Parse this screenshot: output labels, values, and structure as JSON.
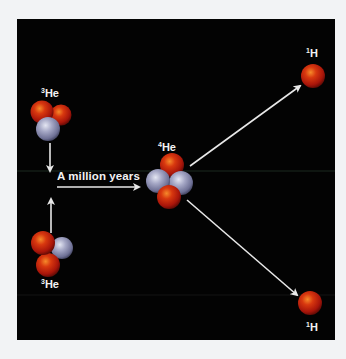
{
  "diagram": {
    "background_color": "#f2f3f5",
    "panel_color": "#030303",
    "proton_color": "#c8200c",
    "neutron_color": "#9a9cbc",
    "arrow_color": "#e8e8e8",
    "nodes": [
      {
        "id": "he3_top",
        "mass": "3",
        "symbol": "He",
        "protons": 2,
        "neutrons": 1
      },
      {
        "id": "he3_bottom",
        "mass": "3",
        "symbol": "He",
        "protons": 2,
        "neutrons": 1
      },
      {
        "id": "he4",
        "mass": "4",
        "symbol": "He",
        "protons": 2,
        "neutrons": 2
      },
      {
        "id": "h1_top",
        "mass": "1",
        "symbol": "H",
        "protons": 1,
        "neutrons": 0
      },
      {
        "id": "h1_bottom",
        "mass": "1",
        "symbol": "H",
        "protons": 1,
        "neutrons": 0
      }
    ],
    "edges": [
      {
        "from": "he3_top",
        "to": "merge"
      },
      {
        "from": "he3_bottom",
        "to": "merge"
      },
      {
        "from": "merge",
        "to": "he4",
        "label": "A million years"
      },
      {
        "from": "he4",
        "to": "h1_top"
      },
      {
        "from": "he4",
        "to": "h1_bottom"
      }
    ],
    "caption": "A million years"
  }
}
